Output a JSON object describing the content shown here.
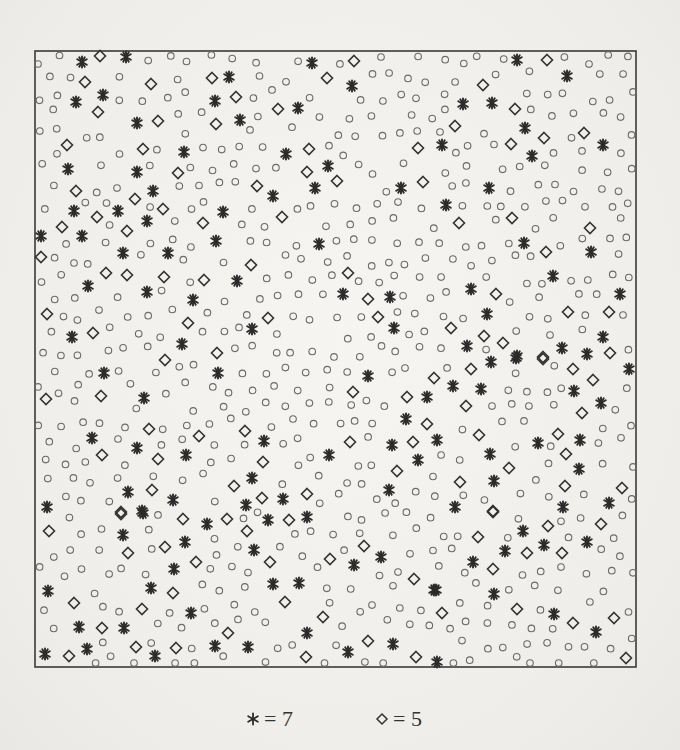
{
  "chart_data": {
    "type": "scatter",
    "title": "",
    "xlabel": "",
    "ylabel": "",
    "grid": false,
    "frame": {
      "left": 35,
      "top": 51,
      "right": 636,
      "bottom": 667
    },
    "legend": [
      {
        "marker": "asterisk",
        "symbol": "*",
        "label": "= 7"
      },
      {
        "marker": "diamond",
        "symbol": "◇",
        "label": "= 5"
      }
    ],
    "series": [
      {
        "name": "7",
        "marker": "asterisk",
        "points": [
          [
            82,
            62
          ],
          [
            126,
            57
          ],
          [
            103,
            95
          ],
          [
            76,
            102
          ],
          [
            137,
            123
          ],
          [
            184,
            152
          ],
          [
            68,
            169
          ],
          [
            137,
            172
          ],
          [
            153,
            191
          ],
          [
            229,
            77
          ],
          [
            215,
            101
          ],
          [
            312,
            63
          ],
          [
            352,
            86
          ],
          [
            298,
            108
          ],
          [
            240,
            120
          ],
          [
            286,
            154
          ],
          [
            328,
            166
          ],
          [
            315,
            188
          ],
          [
            273,
            196
          ],
          [
            401,
            188
          ],
          [
            517,
            60
          ],
          [
            567,
            76
          ],
          [
            463,
            104
          ],
          [
            492,
            103
          ],
          [
            525,
            128
          ],
          [
            442,
            145
          ],
          [
            532,
            156
          ],
          [
            603,
            145
          ],
          [
            489,
            188
          ],
          [
            74,
            211
          ],
          [
            118,
            211
          ],
          [
            147,
            221
          ],
          [
            41,
            236
          ],
          [
            82,
            236
          ],
          [
            123,
            253
          ],
          [
            168,
            253
          ],
          [
            216,
            241
          ],
          [
            223,
            212
          ],
          [
            88,
            286
          ],
          [
            147,
            292
          ],
          [
            193,
            300
          ],
          [
            72,
            337
          ],
          [
            182,
            344
          ],
          [
            319,
            244
          ],
          [
            237,
            281
          ],
          [
            343,
            294
          ],
          [
            390,
            297
          ],
          [
            252,
            329
          ],
          [
            394,
            328
          ],
          [
            446,
            205
          ],
          [
            524,
            243
          ],
          [
            591,
            252
          ],
          [
            553,
            276
          ],
          [
            471,
            289
          ],
          [
            620,
            294
          ],
          [
            487,
            314
          ],
          [
            603,
            337
          ],
          [
            467,
            346
          ],
          [
            562,
            348
          ],
          [
            587,
            354
          ],
          [
            517,
            356
          ],
          [
            104,
            373
          ],
          [
            218,
            373
          ],
          [
            144,
            398
          ],
          [
            92,
            438
          ],
          [
            137,
            448
          ],
          [
            186,
            455
          ],
          [
            128,
            492
          ],
          [
            173,
            500
          ],
          [
            47,
            507
          ],
          [
            142,
            511
          ],
          [
            368,
            376
          ],
          [
            427,
            397
          ],
          [
            406,
            419
          ],
          [
            264,
            441
          ],
          [
            392,
            445
          ],
          [
            329,
            455
          ],
          [
            418,
            460
          ],
          [
            252,
            478
          ],
          [
            389,
            490
          ],
          [
            283,
            499
          ],
          [
            246,
            505
          ],
          [
            491,
            362
          ],
          [
            516,
            358
          ],
          [
            629,
            369
          ],
          [
            453,
            386
          ],
          [
            481,
            389
          ],
          [
            574,
            391
          ],
          [
            601,
            403
          ],
          [
            437,
            440
          ],
          [
            538,
            443
          ],
          [
            580,
            440
          ],
          [
            490,
            454
          ],
          [
            579,
            469
          ],
          [
            494,
            481
          ],
          [
            609,
            503
          ],
          [
            455,
            507
          ],
          [
            563,
            507
          ],
          [
            143,
            513
          ],
          [
            207,
            524
          ],
          [
            123,
            535
          ],
          [
            185,
            542
          ],
          [
            174,
            569
          ],
          [
            48,
            591
          ],
          [
            151,
            588
          ],
          [
            191,
            613
          ],
          [
            79,
            627
          ],
          [
            124,
            628
          ],
          [
            87,
            649
          ],
          [
            45,
            654
          ],
          [
            155,
            656
          ],
          [
            215,
            646
          ],
          [
            268,
            520
          ],
          [
            307,
            517
          ],
          [
            254,
            550
          ],
          [
            381,
            557
          ],
          [
            354,
            565
          ],
          [
            273,
            584
          ],
          [
            299,
            583
          ],
          [
            434,
            590
          ],
          [
            307,
            633
          ],
          [
            393,
            644
          ],
          [
            248,
            647
          ],
          [
            348,
            652
          ],
          [
            523,
            531
          ],
          [
            544,
            545
          ],
          [
            587,
            542
          ],
          [
            505,
            551
          ],
          [
            473,
            562
          ],
          [
            436,
            590
          ],
          [
            494,
            594
          ],
          [
            554,
            614
          ],
          [
            596,
            632
          ],
          [
            437,
            662
          ]
        ]
      },
      {
        "name": "5",
        "marker": "diamond",
        "points": [
          [
            100,
            56
          ],
          [
            85,
            82
          ],
          [
            151,
            84
          ],
          [
            98,
            112
          ],
          [
            158,
            121
          ],
          [
            212,
            78
          ],
          [
            216,
            124
          ],
          [
            67,
            145
          ],
          [
            143,
            149
          ],
          [
            178,
            173
          ],
          [
            76,
            191
          ],
          [
            135,
            199
          ],
          [
            354,
            61
          ],
          [
            327,
            78
          ],
          [
            236,
            97
          ],
          [
            278,
            109
          ],
          [
            309,
            149
          ],
          [
            307,
            172
          ],
          [
            337,
            181
          ],
          [
            257,
            186
          ],
          [
            418,
            148
          ],
          [
            423,
            182
          ],
          [
            547,
            60
          ],
          [
            483,
            85
          ],
          [
            515,
            109
          ],
          [
            455,
            126
          ],
          [
            544,
            138
          ],
          [
            584,
            133
          ],
          [
            511,
            144
          ],
          [
            97,
            217
          ],
          [
            62,
            227
          ],
          [
            127,
            231
          ],
          [
            163,
            209
          ],
          [
            203,
            223
          ],
          [
            41,
            257
          ],
          [
            106,
            273
          ],
          [
            127,
            275
          ],
          [
            164,
            277
          ],
          [
            204,
            280
          ],
          [
            47,
            314
          ],
          [
            188,
            323
          ],
          [
            93,
            333
          ],
          [
            217,
            353
          ],
          [
            282,
            217
          ],
          [
            251,
            265
          ],
          [
            348,
            273
          ],
          [
            368,
            299
          ],
          [
            268,
            318
          ],
          [
            378,
            317
          ],
          [
            459,
            223
          ],
          [
            512,
            218
          ],
          [
            590,
            228
          ],
          [
            546,
            252
          ],
          [
            496,
            294
          ],
          [
            568,
            312
          ],
          [
            609,
            312
          ],
          [
            451,
            328
          ],
          [
            484,
            336
          ],
          [
            503,
            343
          ],
          [
            610,
            353
          ],
          [
            543,
            357
          ],
          [
            165,
            360
          ],
          [
            46,
            399
          ],
          [
            101,
            396
          ],
          [
            149,
            429
          ],
          [
            199,
            436
          ],
          [
            102,
            455
          ],
          [
            158,
            459
          ],
          [
            152,
            490
          ],
          [
            121,
            512
          ],
          [
            353,
            392
          ],
          [
            407,
            397
          ],
          [
            427,
            424
          ],
          [
            245,
            431
          ],
          [
            350,
            442
          ],
          [
            413,
            442
          ],
          [
            263,
            462
          ],
          [
            397,
            471
          ],
          [
            307,
            494
          ],
          [
            234,
            486
          ],
          [
            262,
            498
          ],
          [
            543,
            359
          ],
          [
            471,
            369
          ],
          [
            573,
            369
          ],
          [
            434,
            378
          ],
          [
            593,
            380
          ],
          [
            466,
            406
          ],
          [
            582,
            413
          ],
          [
            479,
            435
          ],
          [
            558,
            434
          ],
          [
            566,
            454
          ],
          [
            509,
            468
          ],
          [
            460,
            482
          ],
          [
            565,
            486
          ],
          [
            622,
            488
          ],
          [
            493,
            511
          ],
          [
            121,
            514
          ],
          [
            183,
            519
          ],
          [
            227,
            519
          ],
          [
            49,
            531
          ],
          [
            165,
            547
          ],
          [
            128,
            553
          ],
          [
            196,
            562
          ],
          [
            173,
            593
          ],
          [
            74,
            603
          ],
          [
            142,
            609
          ],
          [
            102,
            628
          ],
          [
            228,
            633
          ],
          [
            136,
            647
          ],
          [
            176,
            648
          ],
          [
            69,
            656
          ],
          [
            289,
            520
          ],
          [
            247,
            531
          ],
          [
            364,
            546
          ],
          [
            270,
            562
          ],
          [
            330,
            559
          ],
          [
            414,
            579
          ],
          [
            285,
            602
          ],
          [
            323,
            617
          ],
          [
            368,
            641
          ],
          [
            306,
            657
          ],
          [
            416,
            657
          ],
          [
            493,
            512
          ],
          [
            548,
            526
          ],
          [
            601,
            524
          ],
          [
            478,
            537
          ],
          [
            527,
            553
          ],
          [
            562,
            553
          ],
          [
            493,
            569
          ],
          [
            442,
            613
          ],
          [
            517,
            609
          ],
          [
            573,
            623
          ],
          [
            614,
            618
          ],
          [
            626,
            658
          ]
        ]
      },
      {
        "name": "other",
        "marker": "circle",
        "generated": {
          "spacing": 21,
          "jitter": 6,
          "min_gap": 13,
          "seed": 7
        }
      }
    ]
  },
  "legend": {
    "star_label": "= 7",
    "diamond_label": "= 5"
  },
  "colors": {
    "frame": "#3a3a3a",
    "star": "#2b2b2b",
    "diamond": "#333333",
    "circle": "#6a6a6a",
    "paper": "#f1f0ed"
  }
}
